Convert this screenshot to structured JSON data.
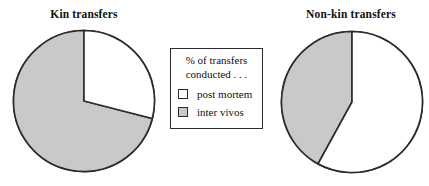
{
  "figure": {
    "background": "#ffffff",
    "outline_color": "#2b2b2b",
    "gray_fill": "#c9c9c9",
    "white_fill": "#ffffff"
  },
  "legend": {
    "heading_line1": "% of transfers",
    "heading_line2": "conducted . . .",
    "items": [
      {
        "label": "post mortem",
        "swatch": "white-square-icon",
        "color": "#ffffff"
      },
      {
        "label": "inter vivos",
        "swatch": "gray-square-icon",
        "color": "#c9c9c9"
      }
    ]
  },
  "chart_data": [
    {
      "type": "pie",
      "title": "Kin transfers",
      "categories": [
        "post mortem",
        "inter vivos"
      ],
      "values": [
        29,
        71
      ],
      "unit": "%",
      "colors": [
        "#ffffff",
        "#c9c9c9"
      ],
      "start_angle_deg": 0,
      "direction": "clockwise",
      "legend_position": "center",
      "grid": false
    },
    {
      "type": "pie",
      "title": "Non-kin transfers",
      "categories": [
        "post mortem",
        "inter vivos"
      ],
      "values": [
        58,
        42
      ],
      "unit": "%",
      "colors": [
        "#ffffff",
        "#c9c9c9"
      ],
      "start_angle_deg": 0,
      "direction": "clockwise",
      "legend_position": "center",
      "grid": false
    }
  ]
}
